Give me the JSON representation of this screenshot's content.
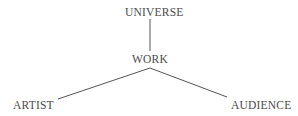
{
  "diagram": {
    "type": "tree",
    "nodes": [
      {
        "id": "universe",
        "label": "UNIVERSE"
      },
      {
        "id": "work",
        "label": "WORK"
      },
      {
        "id": "artist",
        "label": "ARTIST"
      },
      {
        "id": "audience",
        "label": "AUDIENCE"
      }
    ],
    "edges": [
      {
        "from": "universe",
        "to": "work"
      },
      {
        "from": "work",
        "to": "artist"
      },
      {
        "from": "work",
        "to": "audience"
      }
    ],
    "colors": {
      "text": "#4a4a4a",
      "line": "#555555",
      "background": "#ffffff"
    }
  }
}
